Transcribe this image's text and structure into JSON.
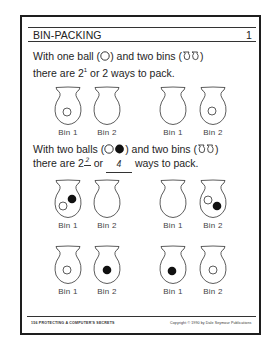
{
  "worksheet": {
    "title": "BIN-PACKING",
    "number": "1"
  },
  "section1": {
    "line1_a": "With one ball (",
    "line1_b": ") and two bins (",
    "line1_c": ")",
    "line2_a": "there are 2",
    "line2_sup": "1",
    "line2_b": " or 2 ways to pack."
  },
  "section2": {
    "line1_a": "With two balls (",
    "line1_b": ") and two bins (",
    "line1_c": ")",
    "line2_a": "there are 2",
    "line2_sup_answer": "2",
    "line2_b": " or ",
    "line2_answer": "4",
    "line2_c": " ways to pack."
  },
  "bins": {
    "bin1_label": "Bin 1",
    "bin2_label": "Bin 2"
  },
  "arrangements": [
    {
      "row": 1,
      "group": "left",
      "bin1": [
        "white"
      ],
      "bin2": []
    },
    {
      "row": 1,
      "group": "right",
      "bin1": [],
      "bin2": [
        "white"
      ]
    },
    {
      "row": 2,
      "group": "left",
      "bin1": [
        "white",
        "black"
      ],
      "bin2": []
    },
    {
      "row": 2,
      "group": "right",
      "bin1": [],
      "bin2": [
        "white",
        "black"
      ]
    },
    {
      "row": 3,
      "group": "left",
      "bin1": [
        "white"
      ],
      "bin2": [
        "black"
      ]
    },
    {
      "row": 3,
      "group": "right",
      "bin1": [
        "black"
      ],
      "bin2": [
        "white"
      ]
    }
  ],
  "footer": {
    "left": "156  PROTECTING A COMPUTER'S SECRETS",
    "right": "Copyright © 1990 by Dale Seymour Publications"
  },
  "colors": {
    "ink": "#1e1e1e",
    "paper": "#ffffff",
    "ball_black": "#111111"
  }
}
